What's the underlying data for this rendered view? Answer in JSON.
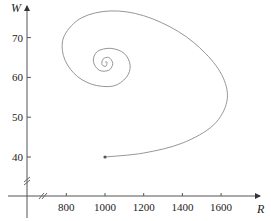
{
  "chart_data": {
    "type": "line",
    "title": "",
    "xlabel": "R",
    "ylabel": "W",
    "xlim": [
      670,
      1780
    ],
    "ylim": [
      30,
      80
    ],
    "x_ticks": [
      800,
      1000,
      1200,
      1400,
      1600
    ],
    "y_ticks": [
      40,
      50,
      60,
      70
    ],
    "x_tick_labels": [
      "800",
      "1000",
      "1200",
      "1400",
      "1600"
    ],
    "y_tick_labels": [
      "40",
      "50",
      "60",
      "70"
    ],
    "grid": false,
    "legend": null,
    "axis_breaks": [
      "x",
      "y"
    ],
    "start_point": {
      "R": 1000,
      "W": 40
    },
    "equilibrium": {
      "R": 1000,
      "W": 63.5
    },
    "series": [
      {
        "name": "phase trajectory",
        "points": [
          {
            "R": 1000,
            "W": 40
          },
          {
            "R": 1200,
            "W": 41
          },
          {
            "R": 1400,
            "W": 43.5
          },
          {
            "R": 1560,
            "W": 48
          },
          {
            "R": 1630,
            "W": 54
          },
          {
            "R": 1610,
            "W": 60
          },
          {
            "R": 1520,
            "W": 66
          },
          {
            "R": 1380,
            "W": 71.5
          },
          {
            "R": 1200,
            "W": 75.5
          },
          {
            "R": 1030,
            "W": 76.7
          },
          {
            "R": 880,
            "W": 75
          },
          {
            "R": 790,
            "W": 70.5
          },
          {
            "R": 785,
            "W": 65.5
          },
          {
            "R": 840,
            "W": 61
          },
          {
            "R": 930,
            "W": 58.3
          },
          {
            "R": 1040,
            "W": 57.8
          },
          {
            "R": 1110,
            "W": 60
          },
          {
            "R": 1130,
            "W": 63
          },
          {
            "R": 1100,
            "W": 66
          },
          {
            "R": 1030,
            "W": 67.3
          },
          {
            "R": 960,
            "W": 66.5
          },
          {
            "R": 940,
            "W": 64
          },
          {
            "R": 970,
            "W": 61.8
          },
          {
            "R": 1020,
            "W": 61.8
          },
          {
            "R": 1040,
            "W": 63.5
          },
          {
            "R": 1020,
            "W": 65
          },
          {
            "R": 990,
            "W": 64.6
          },
          {
            "R": 985,
            "W": 63.2
          },
          {
            "R": 1005,
            "W": 62.8
          },
          {
            "R": 1010,
            "W": 63.8
          },
          {
            "R": 1000,
            "W": 63.9
          }
        ]
      }
    ]
  },
  "axes": {
    "x_label": "R",
    "y_label": "W",
    "x_ticks": [
      "800",
      "1000",
      "1200",
      "1400",
      "1600"
    ],
    "y_ticks": [
      "70",
      "60",
      "50",
      "40"
    ]
  },
  "colors": {
    "curve": "#8a8a8a",
    "axis": "#444444",
    "text": "#222222"
  }
}
